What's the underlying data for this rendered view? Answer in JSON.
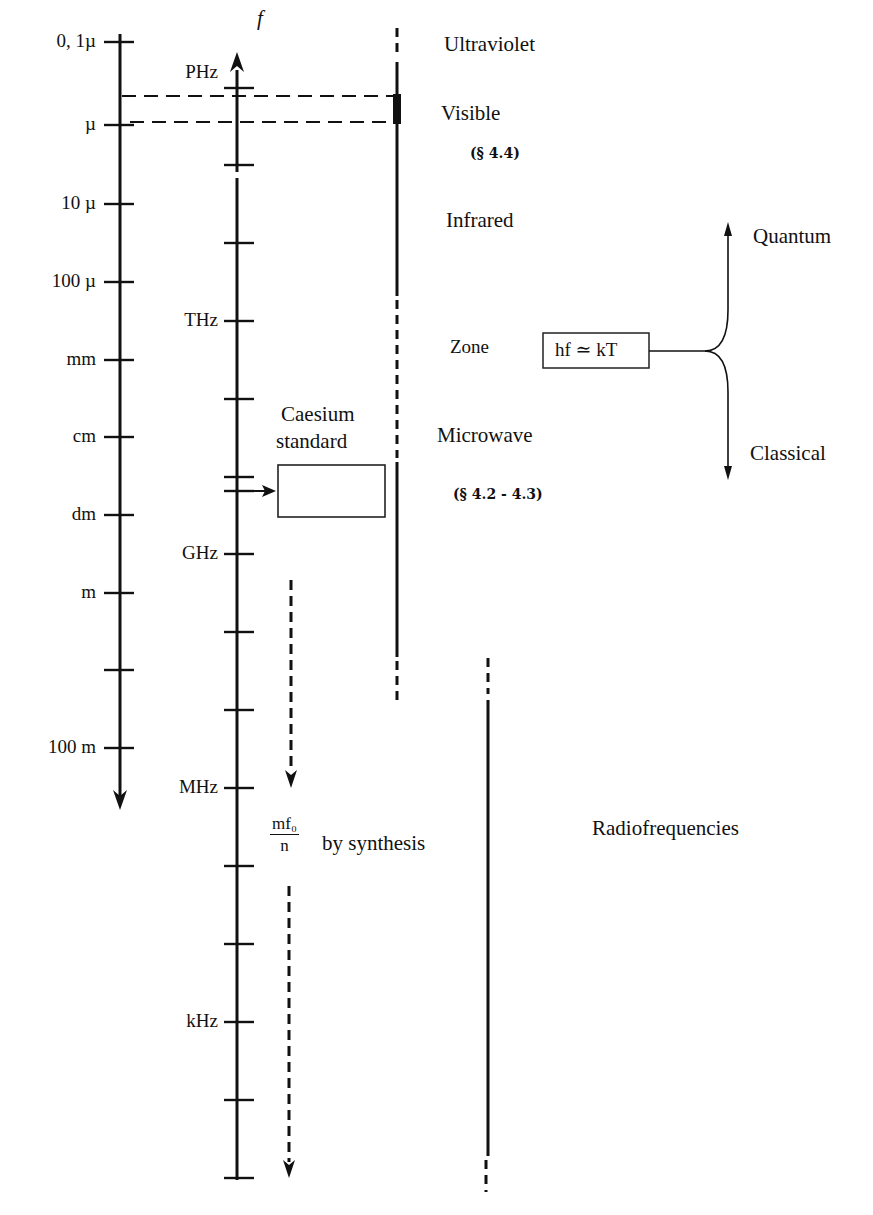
{
  "header": {
    "cropped_title_fragment": "frequency"
  },
  "wavelength_axis": {
    "name": "wavelength",
    "direction": "down",
    "ticks": [
      {
        "label": "0, 1µ",
        "y": 42
      },
      {
        "label": "µ",
        "y": 125
      },
      {
        "label": "10 µ",
        "y": 204
      },
      {
        "label": "100 µ",
        "y": 282
      },
      {
        "label": "mm",
        "y": 360
      },
      {
        "label": "cm",
        "y": 437
      },
      {
        "label": "dm",
        "y": 515
      },
      {
        "label": "m",
        "y": 593
      },
      {
        "label": "",
        "y": 670
      },
      {
        "label": "100 m",
        "y": 748
      }
    ]
  },
  "frequency_axis": {
    "name": "f",
    "direction": "up",
    "ticks": [
      {
        "label": "PHz",
        "y": 88
      },
      {
        "label": "",
        "y": 165
      },
      {
        "label": "",
        "y": 243
      },
      {
        "label": "THz",
        "y": 321
      },
      {
        "label": "",
        "y": 399
      },
      {
        "label": "",
        "y": 477
      },
      {
        "label": "",
        "y": 491
      },
      {
        "label": "GHz",
        "y": 554
      },
      {
        "label": "",
        "y": 632
      },
      {
        "label": "",
        "y": 710
      },
      {
        "label": "MHz",
        "y": 788
      },
      {
        "label": "",
        "y": 866
      },
      {
        "label": "",
        "y": 944
      },
      {
        "label": "kHz",
        "y": 1022
      },
      {
        "label": "",
        "y": 1100
      },
      {
        "label": "",
        "y": 1178
      }
    ]
  },
  "bands": {
    "ultraviolet": "Ultraviolet",
    "visible": "Visible",
    "visible_ref": "(§ 4.4)",
    "infrared": "Infrared",
    "zone": "Zone",
    "microwave": "Microwave",
    "microwave_ref": "(§ 4.2 - 4.3)",
    "radiofrequencies": "Radiofrequencies"
  },
  "caesium": {
    "line1": "Caesium",
    "line2": "standard"
  },
  "synthesis": {
    "numerator": "mf₀",
    "denominator": "n",
    "text": "by synthesis"
  },
  "regime": {
    "equation": "hf ≃ kT",
    "upper": "Quantum",
    "lower": "Classical"
  }
}
